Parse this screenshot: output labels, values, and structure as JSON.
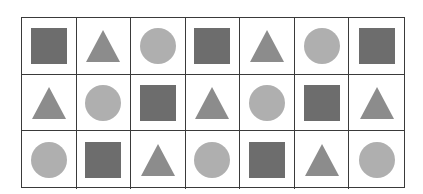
{
  "grid": {
    "rows": 3,
    "columns": 7,
    "colors": {
      "square": "#6d6d6d",
      "triangle": "#8c8c8c",
      "circle": "#afafaf",
      "border": "#3a3a3a"
    },
    "cells": [
      [
        "square",
        "triangle",
        "circle",
        "square",
        "triangle",
        "circle",
        "square"
      ],
      [
        "triangle",
        "circle",
        "square",
        "triangle",
        "circle",
        "square",
        "triangle"
      ],
      [
        "circle",
        "square",
        "triangle",
        "circle",
        "square",
        "triangle",
        "circle"
      ]
    ]
  }
}
